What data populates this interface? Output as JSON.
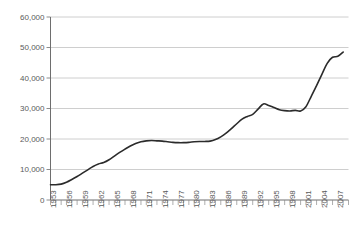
{
  "chart_data": {
    "type": "line",
    "title": "",
    "subtitle": "",
    "xlabel": "",
    "ylabel": "",
    "xlim": [
      1953,
      2009
    ],
    "ylim": [
      0,
      60000
    ],
    "grid": true,
    "legend": false,
    "legend_position": "none",
    "y_ticks": [
      0,
      10000,
      20000,
      30000,
      40000,
      50000,
      60000
    ],
    "y_tick_labels": [
      "0",
      "10,000",
      "20,000",
      "30,000",
      "40,000",
      "50,000",
      "60,000"
    ],
    "x_tick_labels": [
      "1953",
      "1956",
      "1959",
      "1962",
      "1965",
      "1968",
      "1971",
      "1974",
      "1977",
      "1980",
      "1983",
      "1986",
      "1989",
      "1992",
      "1995",
      "1998",
      "2001",
      "2004",
      "2007"
    ],
    "x_tick_label_step": 3,
    "x_minor_tick_step": 1,
    "series": [
      {
        "name": "series-1",
        "color": "#2b2b2b",
        "x": [
          1953,
          1954,
          1955,
          1956,
          1957,
          1958,
          1959,
          1960,
          1961,
          1962,
          1963,
          1964,
          1965,
          1966,
          1967,
          1968,
          1969,
          1970,
          1971,
          1972,
          1973,
          1974,
          1975,
          1976,
          1977,
          1978,
          1979,
          1980,
          1981,
          1982,
          1983,
          1984,
          1985,
          1986,
          1987,
          1988,
          1989,
          1990,
          1991,
          1992,
          1993,
          1994,
          1995,
          1996,
          1997,
          1998,
          1999,
          2000,
          2001,
          2002,
          2003,
          2004,
          2005,
          2006,
          2007,
          2008
        ],
        "values": [
          5000,
          5000,
          5200,
          5800,
          6700,
          7700,
          8800,
          9900,
          11000,
          11800,
          12300,
          13200,
          14400,
          15600,
          16700,
          17700,
          18500,
          19100,
          19400,
          19500,
          19400,
          19300,
          19100,
          18900,
          18800,
          18800,
          18900,
          19100,
          19200,
          19200,
          19300,
          19800,
          20700,
          21900,
          23400,
          25000,
          26500,
          27400,
          28100,
          29800,
          31500,
          31000,
          30300,
          29600,
          29300,
          29200,
          29400,
          29200,
          30600,
          34000,
          37500,
          41200,
          44800,
          46800,
          47100,
          48500
        ]
      }
    ]
  },
  "axes": {
    "y_axis_name": "value-axis",
    "x_axis_name": "year-axis"
  }
}
